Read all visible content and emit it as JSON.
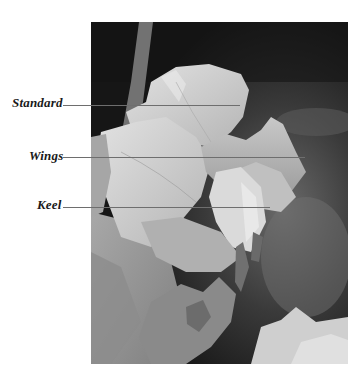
{
  "diagram": {
    "labels": [
      {
        "text": "Standard"
      },
      {
        "text": "Wings"
      },
      {
        "text": "Keel"
      }
    ]
  },
  "colors": {
    "background": "#ffffff",
    "label_text": "#1a1a1a",
    "leader_line": "#6e6e6e",
    "photo_dark": "#1c1c1c",
    "petal_light": "#d4d4d4"
  }
}
